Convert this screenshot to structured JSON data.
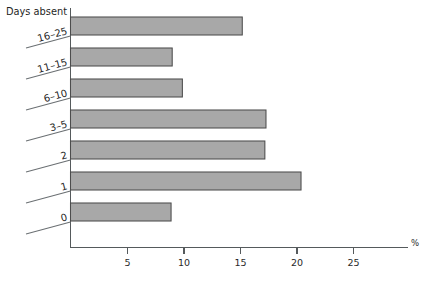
{
  "chart_data": {
    "type": "bar",
    "orientation": "horizontal",
    "title": "",
    "ylabel": "Days absent",
    "xlabel": "%",
    "categories": [
      "0",
      "1",
      "2",
      "3–5",
      "6–10",
      "11–15",
      "16–25"
    ],
    "values": [
      8.9,
      20.4,
      17.2,
      17.3,
      9.9,
      9.0,
      15.2
    ],
    "xlim": [
      0,
      29
    ],
    "xticks": [
      5,
      10,
      15,
      20,
      25
    ],
    "xtick_labels": [
      "5",
      "10",
      "15",
      "20",
      "25"
    ],
    "grid": false,
    "legend": null,
    "bar_color": "#a8a8a8",
    "bar_edge_color": "#4c4c4c",
    "axis_color": "#555a5c"
  },
  "axes": {
    "y_axis_title": "Days absent",
    "x_axis_unit": "%"
  },
  "icons": {
    "bar_series": "bar-series-glyph"
  }
}
